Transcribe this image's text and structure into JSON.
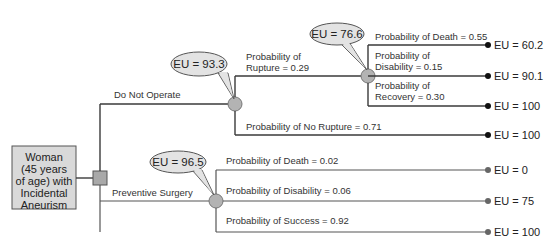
{
  "colors": {
    "root_fill": "#d9d9d9",
    "decision_node": "#a9a9a9",
    "chance_node": "#b3b3b3",
    "bubble_fill": "#e3e3e3",
    "line_dark": "#2b2b2b",
    "line_soft": "#555555",
    "terminal_dark": "#111111",
    "terminal_soft": "#666666"
  },
  "root": {
    "lines": [
      "Woman",
      "(45 years",
      "of age) with",
      "Incidental",
      "Aneurism"
    ]
  },
  "options": [
    {
      "label": "Do Not Operate",
      "eu_bubble": "EU = 93.3",
      "branches": [
        {
          "label_lines": [
            "Probability of",
            "Rupture = 0.29"
          ],
          "eu_bubble": "EU = 76.6",
          "branches": [
            {
              "label_lines": [
                "Probability of Death = 0.55"
              ],
              "outcome": "EU = 60.2"
            },
            {
              "label_lines": [
                "Probability of",
                "Disability = 0.15"
              ],
              "outcome": "EU = 90.1"
            },
            {
              "label_lines": [
                "Probability of",
                "Recovery = 0.30"
              ],
              "outcome": "EU = 100"
            }
          ]
        },
        {
          "label_lines": [
            "Probability of No Rupture = 0.71"
          ],
          "outcome": "EU = 100"
        }
      ]
    },
    {
      "label": "Preventive Surgery",
      "eu_bubble": "EU = 96.5",
      "branches": [
        {
          "label_lines": [
            "Probability of Death = 0.02"
          ],
          "outcome": "EU = 0"
        },
        {
          "label_lines": [
            "Probability of Disability = 0.06"
          ],
          "outcome": "EU = 75"
        },
        {
          "label_lines": [
            "Probability of Success = 0.92"
          ],
          "outcome": "EU = 100"
        }
      ]
    }
  ]
}
